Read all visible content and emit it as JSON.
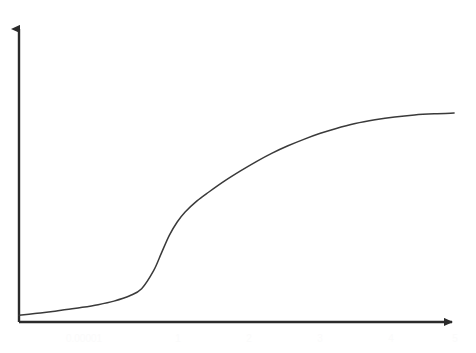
{
  "figure": {
    "top_caption": "",
    "background_color": "#ffffff",
    "axis_color": "#2b2b2b",
    "curve_color": "#3a3a3a",
    "tick_label_color": "#fbfbfb"
  },
  "chart_data": {
    "type": "line",
    "title": "",
    "subtitle": "",
    "xlabel": "",
    "ylabel": "",
    "grid": false,
    "legend": null,
    "legend_position": "none",
    "xlim": [
      0,
      5.6
    ],
    "ylim": [
      0,
      1.08
    ],
    "x_tick_labels": [
      "0.00001",
      "1",
      "2",
      "3",
      "4",
      "5"
    ],
    "x_tick_values": [
      0.0,
      1.0,
      2.0,
      3.0,
      4.0,
      5.0
    ],
    "y_tick_labels": [],
    "y_tick_values": [],
    "series": [
      {
        "name": "sigmoid",
        "color": "#3a3a3a",
        "x": [
          0.0,
          0.2,
          0.4,
          0.6,
          0.8,
          1.0,
          1.2,
          1.4,
          1.55,
          1.7,
          1.8,
          1.9,
          2.0,
          2.1,
          2.25,
          2.4,
          2.6,
          2.8,
          3.0,
          3.2,
          3.4,
          3.6,
          3.8,
          4.0,
          4.25,
          4.5,
          4.75,
          5.0,
          5.25,
          5.5
        ],
        "y": [
          0.03,
          0.038,
          0.046,
          0.056,
          0.066,
          0.078,
          0.094,
          0.118,
          0.15,
          0.23,
          0.31,
          0.39,
          0.45,
          0.495,
          0.545,
          0.585,
          0.635,
          0.68,
          0.722,
          0.76,
          0.793,
          0.822,
          0.848,
          0.87,
          0.893,
          0.91,
          0.923,
          0.932,
          0.937,
          0.94
        ]
      }
    ],
    "axes_style": {
      "x_axis_arrow": true,
      "y_axis_arrow": true,
      "spines": [
        "left",
        "bottom"
      ],
      "ticks_visible": false
    }
  }
}
